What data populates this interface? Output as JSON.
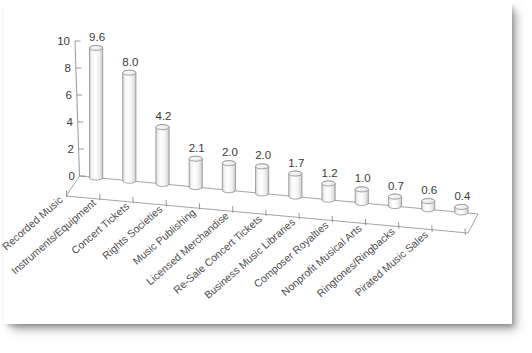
{
  "chart_data": {
    "type": "bar",
    "title": "",
    "subtitle": "",
    "xlabel": "",
    "ylabel": "",
    "ylim": [
      0,
      10
    ],
    "yticks": [
      "0",
      "2",
      "4",
      "6",
      "8",
      "10"
    ],
    "ytick_values": [
      0,
      2,
      4,
      6,
      8,
      10
    ],
    "grid": false,
    "legend": false,
    "legend_position": "none",
    "style": "3d-cylinder",
    "categories": [
      "Recorded Music",
      "Instruments/Equipment",
      "Concert Tickets",
      "Rights Societies",
      "Music Publishing",
      "Licensed Merchandise",
      "Re-Sale Concert Tickets",
      "Business Music Libraries",
      "Composer Royalties",
      "Nonprofit Musical Arts",
      "Ringtones/Ringbacks",
      "Pirated Music Sales"
    ],
    "values": [
      9.6,
      8.0,
      4.2,
      2.1,
      2.0,
      2.0,
      1.7,
      1.2,
      1.0,
      0.7,
      0.6,
      0.4
    ],
    "value_labels": [
      "9.6",
      "8.0",
      "4.2",
      "2.1",
      "2.0",
      "2.0",
      "1.7",
      "1.2",
      "1.0",
      "0.7",
      "0.6",
      "0.4"
    ]
  },
  "colors": {
    "background": "#ffffff",
    "card": "#ffffff",
    "axis": "#8d8d8d",
    "bar_fill_light": "#ffffff",
    "bar_fill_shade": "#d9d9d9",
    "bar_stroke": "#8a8a8a",
    "text": "#3a3a3a"
  }
}
